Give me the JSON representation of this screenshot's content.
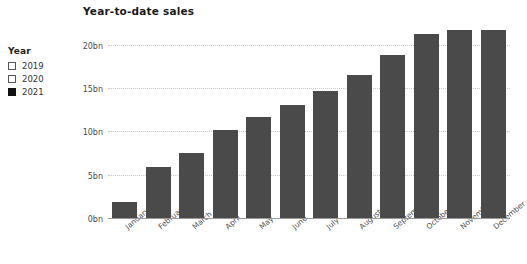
{
  "legend": {
    "title": "Year",
    "items": [
      {
        "label": "2019",
        "checked": false
      },
      {
        "label": "2020",
        "checked": false
      },
      {
        "label": "2021",
        "checked": true
      }
    ]
  },
  "chart_data": {
    "type": "bar",
    "title": "Year-to-date sales",
    "xlabel": "",
    "ylabel": "",
    "ylim": [
      0,
      22.5
    ],
    "grid": true,
    "legend_position": "left",
    "bar_color": "#4a4a4a",
    "yticks": [
      {
        "value": 0,
        "label": "0bn"
      },
      {
        "value": 5,
        "label": "5bn"
      },
      {
        "value": 10,
        "label": "10bn"
      },
      {
        "value": 15,
        "label": "15bn"
      },
      {
        "value": 20,
        "label": "20bn"
      }
    ],
    "categories": [
      "January",
      "February",
      "March",
      "April",
      "May",
      "June",
      "July",
      "August",
      "September",
      "October",
      "November",
      "December"
    ],
    "series": [
      {
        "name": "2021",
        "values": [
          2.0,
          6.0,
          7.6,
          10.3,
          11.8,
          13.2,
          14.8,
          16.6,
          18.9,
          21.4,
          21.8,
          21.8
        ]
      }
    ]
  }
}
